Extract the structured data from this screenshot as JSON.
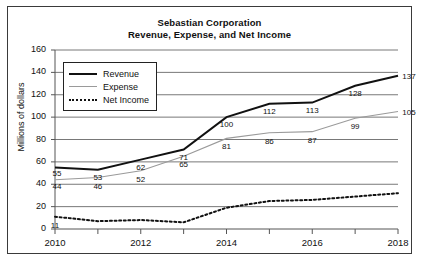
{
  "chart_data": {
    "type": "line",
    "title": "Sebastian Corporation",
    "subtitle": "Revenue, Expense, and Net Income",
    "xlabel": "",
    "ylabel": "Millions of dollars",
    "ylim": [
      0,
      160
    ],
    "ytick_step": 20,
    "ytick_labels": [
      "0",
      "20",
      "40",
      "60",
      "80",
      "100",
      "120",
      "140",
      "160"
    ],
    "xlim": [
      2010,
      2018
    ],
    "x": [
      2010,
      2011,
      2012,
      2013,
      2014,
      2015,
      2016,
      2017,
      2018
    ],
    "xtick_labels": [
      "2010",
      "2012",
      "2014",
      "2016",
      "2018"
    ],
    "xticks_shown": [
      2010,
      2012,
      2014,
      2016,
      2018
    ],
    "grid": "horizontal",
    "legend_position": "upper-left-inside",
    "series": [
      {
        "name": "Revenue",
        "style": "solid-thick-black",
        "color": "#111111",
        "values": [
          55,
          53,
          62,
          71,
          100,
          112,
          113,
          128,
          137
        ],
        "labels": [
          "55",
          "53",
          "62",
          "71",
          "100",
          "112",
          "113",
          "128",
          "137"
        ]
      },
      {
        "name": "Expense",
        "style": "solid-thin-gray",
        "color": "#9a9a9a",
        "values": [
          44,
          46,
          52,
          65,
          81,
          86,
          87,
          99,
          105
        ],
        "labels": [
          "44",
          "46",
          "52",
          "65",
          "81",
          "86",
          "87",
          "99",
          "105"
        ]
      },
      {
        "name": "Net Income",
        "style": "dotted-black",
        "color": "#111111",
        "values": [
          11,
          7,
          8,
          6,
          19,
          25,
          26,
          29,
          32
        ],
        "labels": [
          "11",
          "",
          "",
          "",
          "",
          "",
          "",
          "",
          ""
        ]
      }
    ]
  },
  "legend": {
    "items": [
      {
        "label": "Revenue"
      },
      {
        "label": "Expense"
      },
      {
        "label": "Net Income"
      }
    ]
  },
  "colors": {
    "revenue": "#111111",
    "expense": "#9a9a9a",
    "net_income": "#111111",
    "grid": "#555555",
    "frame": "#3a3a3a"
  }
}
